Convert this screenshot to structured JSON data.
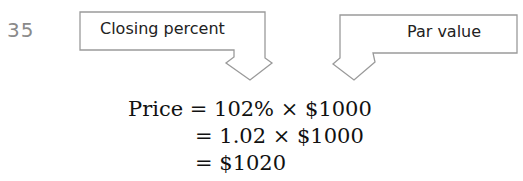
{
  "example_number": "35",
  "callouts": [
    {
      "label": "Closing percent"
    },
    {
      "label": "Par value"
    }
  ],
  "equation": {
    "lhs": "Price",
    "lines": [
      "= 102% × $1000",
      "= 1.02 × $1000",
      "= $1020"
    ]
  }
}
